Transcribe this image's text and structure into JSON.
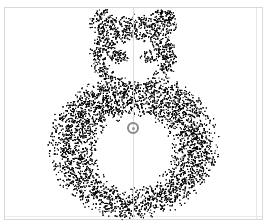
{
  "canvas": {
    "width": 271,
    "height": 224,
    "background": "#ffffff"
  },
  "frame": {
    "x": 4,
    "y": 7,
    "width": 259,
    "height": 213,
    "border_color": "#d8d8d8"
  },
  "guide_line": {
    "x": 133,
    "color": "#dcdcdc"
  },
  "figure": {
    "ink_color": "#000000",
    "head": {
      "cx": 133,
      "cy": 55,
      "rx": 40,
      "ry": 38
    },
    "ears": [
      {
        "cx": 103,
        "cy": 22,
        "r": 13
      },
      {
        "cx": 163,
        "cy": 22,
        "r": 13
      }
    ],
    "face_hole": {
      "cx": 133,
      "cy": 60,
      "rx": 29,
      "ry": 25
    },
    "eyes": [
      {
        "cx": 118,
        "cy": 56,
        "rx": 8,
        "ry": 6
      },
      {
        "cx": 148,
        "cy": 56,
        "rx": 8,
        "ry": 6
      }
    ],
    "body": {
      "cx": 133,
      "cy": 145,
      "rx": 78,
      "ry": 68
    },
    "belly_hole": {
      "cx": 133,
      "cy": 152,
      "rx": 48,
      "ry": 45
    }
  },
  "target": {
    "cx": 133,
    "cy": 128,
    "ring_color": "#8a8a8a"
  }
}
